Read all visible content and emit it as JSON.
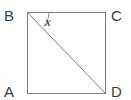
{
  "figure": {
    "kind": "square-with-diagonal",
    "background_color": "#ffffff",
    "line_color": "#7f7f7f",
    "arc_color": "#8a8a8a",
    "label_color": "#3c3c3c",
    "angle_label_color": "#2f2f2f",
    "stroke_width": 1,
    "square": {
      "top_left": [
        27,
        12
      ],
      "top_right": [
        105,
        12
      ],
      "bottom_right": [
        105,
        93
      ],
      "bottom_left": [
        27,
        93
      ],
      "width": 78,
      "height": 81
    },
    "diagonal": {
      "from": "B",
      "to": "D",
      "from_point": [
        27,
        12
      ],
      "to_point": [
        105,
        93
      ]
    },
    "arc": {
      "center": "B",
      "center_point": [
        27,
        12
      ],
      "radius": 22,
      "between": [
        "BD",
        "BC"
      ],
      "path": "M 43.6 26.4 A 22 22 0 0 0 49 12"
    }
  },
  "labels": {
    "vertices": [
      {
        "id": "B",
        "text": "B",
        "position": "top-left",
        "x": 4,
        "y": 8
      },
      {
        "id": "C",
        "text": "C",
        "position": "top-right",
        "x": 111,
        "y": 8
      },
      {
        "id": "A",
        "text": "A",
        "position": "bottom-left",
        "x": 4,
        "y": 84
      },
      {
        "id": "D",
        "text": "D",
        "position": "bottom-right",
        "x": 111,
        "y": 84
      }
    ],
    "angle": {
      "id": "x",
      "text": "x",
      "at_vertex": "B",
      "x": 45,
      "y": 15
    }
  }
}
